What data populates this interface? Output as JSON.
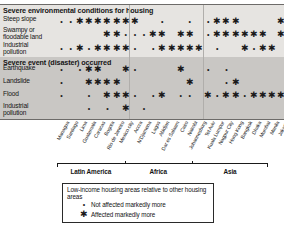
{
  "chart_data": {
    "type": "heatmap",
    "xlabel": "",
    "ylabel": "",
    "grid": false,
    "legend_position": "bottom",
    "symbols": {
      "dot": "•",
      "star": "✱"
    },
    "categories": [
      "Managua",
      "Santiago",
      "Lima",
      "Guatemala",
      "Caracas",
      "Bogota",
      "Rio de Janeiro",
      "Mexico city",
      "Accra",
      "N'Djamena",
      "Lagos",
      "Abidjan",
      "Dar es Salaam",
      "Cairo",
      "Nairobi",
      "Johannesburg",
      "Tel Aviv",
      "Kuala Lumpur",
      "Nagpur City",
      "Hong Kong",
      "Bangkok",
      "Dhaka",
      "Mumbai",
      "Manila",
      "Jakarta"
    ],
    "regions": [
      {
        "label": "Latin America",
        "start": 0,
        "end": 7
      },
      {
        "label": "Africa",
        "start": 8,
        "end": 15
      },
      {
        "label": "Asia",
        "start": 16,
        "end": 24
      }
    ],
    "sections": [
      {
        "title": "Severe environmental conditions for housing",
        "rows": [
          {
            "label": "Steep slope",
            "values": [
              "dot",
              "dot",
              "star",
              "star",
              "star",
              "star",
              "star",
              "star",
              "star",
              "",
              "",
              "dot",
              "",
              "",
              "dot",
              "",
              "dot",
              "star",
              "star",
              "star",
              "",
              "",
              "",
              "",
              "star"
            ]
          },
          {
            "label": "Swampy or floodable land",
            "values": [
              "",
              "",
              "",
              "",
              "",
              "star",
              "star",
              "dot",
              "dot",
              "dot",
              "star",
              "star",
              "",
              "star",
              "star",
              "",
              "dot",
              "star",
              "star",
              "star",
              "star",
              "star",
              "star",
              "",
              "star"
            ]
          },
          {
            "label": "Industrial pollution",
            "values": [
              "dot",
              "dot",
              "star",
              "dot",
              "star",
              "star",
              "star",
              "star",
              "dot",
              "",
              "dot",
              "star",
              "star",
              "star",
              "star",
              "star",
              "",
              "dot",
              "",
              "",
              "star",
              "dot",
              "star",
              "star",
              ""
            ]
          }
        ]
      },
      {
        "title": "Severe event (disaster) occurred",
        "rows": [
          {
            "label": "Earthquake",
            "values": [
              "dot",
              "",
              "dot",
              "star",
              "star",
              "",
              "",
              "star",
              "dot",
              "",
              "",
              "",
              "",
              "star",
              "",
              "",
              "dot",
              "",
              "dot",
              "",
              "",
              "",
              "",
              "",
              ""
            ]
          },
          {
            "label": "Landslide",
            "values": [
              "dot",
              "",
              "",
              "star",
              "star",
              "star",
              "star",
              "",
              "",
              "",
              "",
              "",
              "",
              "",
              "star",
              "",
              "",
              "",
              "dot",
              "star",
              "",
              "",
              "",
              "",
              ""
            ]
          },
          {
            "label": "Flood",
            "values": [
              "dot",
              "",
              "",
              "dot",
              "",
              "star",
              "star",
              "star",
              "dot",
              "",
              "dot",
              "star",
              "",
              "dot",
              "dot",
              "",
              "star",
              "dot",
              "star",
              "star",
              "dot",
              "star",
              "star",
              "star",
              "star"
            ]
          },
          {
            "label": "Industrial pollution",
            "values": [
              "",
              "",
              "",
              "dot",
              "",
              "dot",
              "",
              "star",
              "",
              "dot",
              "",
              "",
              "",
              "",
              "",
              "",
              "",
              "",
              "",
              "",
              "",
              "",
              "",
              "",
              ""
            ]
          }
        ]
      }
    ],
    "legend": {
      "title": "Low-income housing areas relative to other housing areas",
      "entries": [
        {
          "symbol": "dot",
          "label": "Not affected markedly more"
        },
        {
          "symbol": "star",
          "label": "Affected markedly more"
        }
      ]
    }
  }
}
